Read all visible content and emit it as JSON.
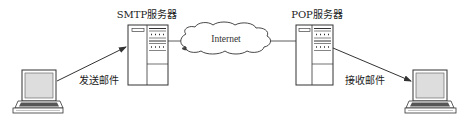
{
  "diagram": {
    "type": "email-flow",
    "nodes": {
      "sender": {
        "label": "",
        "kind": "laptop"
      },
      "smtp_server": {
        "label": "SMTP服务器",
        "kind": "server"
      },
      "internet": {
        "label": "Internet",
        "kind": "cloud"
      },
      "pop_server": {
        "label": "POP服务器",
        "kind": "server"
      },
      "receiver": {
        "label": "",
        "kind": "laptop"
      }
    },
    "edges": [
      {
        "from": "sender",
        "to": "smtp_server",
        "label": "发送邮件",
        "arrow": true
      },
      {
        "from": "smtp_server",
        "to": "internet",
        "label": "",
        "arrow": false
      },
      {
        "from": "internet",
        "to": "pop_server",
        "label": "",
        "arrow": false
      },
      {
        "from": "pop_server",
        "to": "receiver",
        "label": "接收邮件",
        "arrow": true
      }
    ],
    "colors": {
      "line": "#333333",
      "screen_fill": "#dddddd",
      "keyboard_fill": "#555555",
      "background": "#ffffff"
    }
  }
}
